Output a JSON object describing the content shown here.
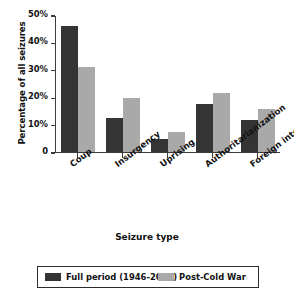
{
  "chart_data": {
    "type": "bar",
    "title": "",
    "xlabel": "Seizure type",
    "ylabel": "Percentage of all seizures",
    "categories": [
      "Coup",
      "Insurgency",
      "Uprising",
      "Authoritarianization",
      "Foreign intervention"
    ],
    "series": [
      {
        "name": "Full period (1946-2010)",
        "color": "#343434",
        "values": [
          46,
          12.7,
          4.8,
          17.7,
          12.0
        ]
      },
      {
        "name": "Post-Cold War",
        "color": "#a9a9a9",
        "values": [
          31,
          19.8,
          7.5,
          21.6,
          15.7
        ]
      }
    ],
    "ylim": [
      0,
      50
    ],
    "yticks": [
      0,
      10,
      20,
      30,
      40,
      50
    ],
    "ytick_labels": [
      "0",
      "10%",
      "20%",
      "30%",
      "40%",
      "50%"
    ],
    "grid": false,
    "legend_position": "bottom"
  },
  "legend": {
    "entries": [
      {
        "label": "Full period (1946-2010)"
      },
      {
        "label": "Post-Cold War"
      }
    ]
  },
  "axes": {
    "x_title": "Seizure type",
    "y_title": "Percentage of all seizures"
  }
}
